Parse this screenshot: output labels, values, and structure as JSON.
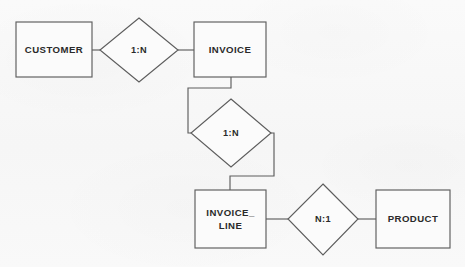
{
  "diagram": {
    "type": "entity-relationship-diagram",
    "background_color": "#f8f8f8",
    "line_color": "#5d5d5d",
    "text_color": "#2a2a2a",
    "entities": [
      {
        "id": "customer",
        "label": "CUSTOMER",
        "shape": "rectangle",
        "x": 16,
        "y": 22,
        "width": 76,
        "height": 55
      },
      {
        "id": "invoice",
        "label": "INVOICE",
        "shape": "rectangle",
        "x": 194,
        "y": 22,
        "width": 72,
        "height": 55
      },
      {
        "id": "invoice_line",
        "label": "INVOICE_ LINE",
        "label_line1": "INVOICE_",
        "label_line2": "LINE",
        "shape": "rectangle",
        "x": 195,
        "y": 190,
        "width": 71,
        "height": 58
      },
      {
        "id": "product",
        "label": "PRODUCT",
        "shape": "rectangle",
        "x": 376,
        "y": 190,
        "width": 74,
        "height": 58
      }
    ],
    "relationships": [
      {
        "id": "customer-invoice",
        "label": "1:N",
        "shape": "diamond",
        "cx": 139,
        "cy": 50,
        "rx": 39,
        "ry": 32,
        "from": "customer",
        "to": "invoice"
      },
      {
        "id": "invoice-invoice_line",
        "label": "1:N",
        "shape": "diamond",
        "cx": 231,
        "cy": 133,
        "rx": 40,
        "ry": 34,
        "from": "invoice",
        "to": "invoice_line"
      },
      {
        "id": "invoice_line-product",
        "label": "N:1",
        "shape": "diamond",
        "cx": 323,
        "cy": 219,
        "rx": 35,
        "ry": 36,
        "from": "invoice_line",
        "to": "product"
      }
    ],
    "connectors": [
      {
        "id": "customer-to-rel1",
        "path": "M 92 50 L 100 50"
      },
      {
        "id": "rel1-to-invoice",
        "path": "M 178 50 L 194 50"
      },
      {
        "id": "invoice-to-rel2",
        "path": "M 231 77 L 231 88 L 188 88 L 188 133 L 191 133"
      },
      {
        "id": "rel2-to-invoice_line",
        "path": "M 271 133 L 274 133 L 274 176 L 230 176 L 230 190"
      },
      {
        "id": "invoice_line-to-rel3",
        "path": "M 266 219 L 288 219"
      },
      {
        "id": "rel3-to-product",
        "path": "M 358 219 L 376 219"
      }
    ]
  }
}
